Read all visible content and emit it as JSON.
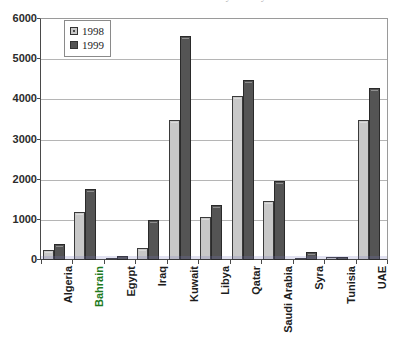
{
  "chart_data": {
    "type": "bar",
    "title": "Arab Countries Internet Hosts by Country 1998-1999",
    "xlabel": "",
    "ylabel": "",
    "ylim": [
      0,
      6000
    ],
    "ytick_step": 1000,
    "yticks": [
      "6000",
      "5000",
      "4000",
      "3000",
      "2000",
      "1000",
      "0"
    ],
    "grid": true,
    "legend_position": "top-left-inside",
    "categories": [
      "Algeria",
      "Bahrain",
      "Egypt",
      "Iraq",
      "Kuwait",
      "Libya",
      "Qatar",
      "Saudi Arabia",
      "Syra",
      "Tunisia",
      "UAE"
    ],
    "series": [
      {
        "name": "1998",
        "color": "#c8c8c8",
        "values": [
          250,
          1200,
          60,
          310,
          3480,
          1080,
          4080,
          1470,
          50,
          70,
          3480
        ]
      },
      {
        "name": "1999",
        "color": "#545454",
        "values": [
          400,
          1780,
          90,
          1000,
          5580,
          1380,
          4470,
          1970,
          190,
          80,
          4280
        ]
      }
    ],
    "highlight_category": "Bahrain",
    "highlight_color": "#1d7a1d"
  },
  "legend": {
    "items": [
      {
        "label": "1998"
      },
      {
        "label": "1999"
      }
    ]
  }
}
